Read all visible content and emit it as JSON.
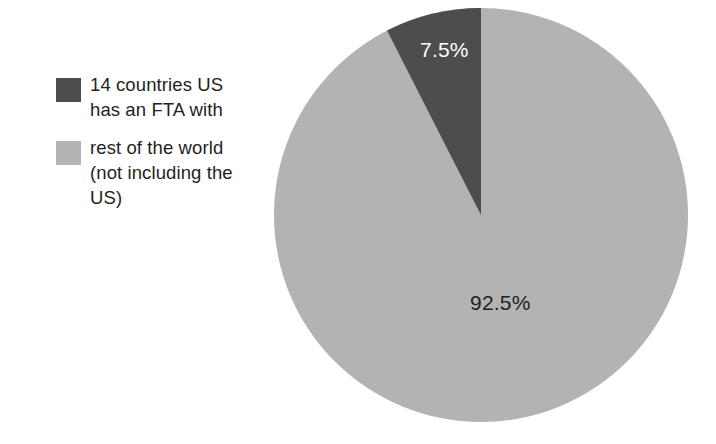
{
  "background_color": "#ffffff",
  "legend": {
    "position": "left",
    "items": [
      {
        "swatch_name": "legend-swatch-dark",
        "color": "#4d4d4d",
        "label": "14 countries US\nhas an FTA with"
      },
      {
        "swatch_name": "legend-swatch-light",
        "color": "#b3b3b3",
        "label": "rest of the world\n(not including the\nUS)"
      }
    ]
  },
  "labels": {
    "dark_slice": "7.5%",
    "light_slice": "92.5%"
  },
  "chart_data": {
    "type": "pie",
    "title": "",
    "categories": [
      "14 countries US has an FTA with",
      "rest of the world (not including the US)"
    ],
    "values": [
      7.5,
      92.5
    ],
    "value_labels": [
      "7.5%",
      "92.5%"
    ],
    "colors": [
      "#4d4d4d",
      "#b3b3b3"
    ],
    "units": "percent",
    "total": 100,
    "start_angle_deg": 0,
    "direction": "counterclockwise",
    "legend": true,
    "legend_position": "left",
    "grid": false,
    "xlabel": "",
    "ylabel": "",
    "geometry": {
      "center_x": 481,
      "center_y": 215,
      "radius": 207
    }
  }
}
